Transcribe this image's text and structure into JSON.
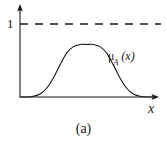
{
  "figure": {
    "caption": "(a)",
    "background_color": "#ffffff",
    "ink_color": "#1a1a1a"
  },
  "axes": {
    "y_axis_max_label": "1",
    "x_axis_label": "x",
    "origin": {
      "x": 20,
      "y": 97
    },
    "y_axis_top": {
      "x": 20,
      "y": 5
    },
    "x_axis_right": {
      "x": 158,
      "y": 97
    }
  },
  "reference_line": {
    "name": "unity-dashed-line",
    "value": 1,
    "y_pixel": 24,
    "x_start": 20,
    "x_end": 161,
    "style": "dashed",
    "dash_length": 8,
    "dash_gap": 7
  },
  "curve": {
    "label_mu": "μ",
    "label_subscript": "A",
    "label_argument": "(x)",
    "label_full": "μA (x)",
    "type": "bell",
    "peak_value": 0.72,
    "peak_pixel": {
      "x": 82,
      "y": 45
    },
    "baseline_y": 97,
    "path": "M 20 96.6 L 26 96.4 C 32 96 38 92 44 84 C 50 74 54 62 60 54 C 66 47 73 44.5 82 44.5 C 91 44.5 98 47 104 54 C 110 62 114 74 120 84 C 126 92 132 96 138 96.4 L 156 96.8"
  },
  "chart_data": {
    "type": "line",
    "title": "",
    "subtitle": "",
    "xlabel": "x",
    "ylabel": "",
    "caption": "(a)",
    "series": [
      {
        "name": "μA (x)",
        "kind": "membership-function",
        "x": [
          0.0,
          0.05,
          0.1,
          0.15,
          0.2,
          0.25,
          0.3,
          0.35,
          0.4,
          0.45,
          0.5,
          0.55,
          0.6,
          0.65,
          0.7,
          0.75,
          0.8,
          0.85,
          0.9,
          0.95,
          1.0
        ],
        "values": [
          0.0,
          0.0,
          0.01,
          0.04,
          0.12,
          0.26,
          0.44,
          0.6,
          0.69,
          0.72,
          0.72,
          0.72,
          0.69,
          0.6,
          0.44,
          0.26,
          0.12,
          0.04,
          0.01,
          0.0,
          0.0
        ]
      },
      {
        "name": "1",
        "kind": "reference-dashed",
        "x": [
          0.0,
          1.0
        ],
        "values": [
          1.0,
          1.0
        ]
      }
    ],
    "ytick_labels": [
      "1"
    ],
    "ytick_values": [
      1
    ],
    "xtick_labels": [],
    "ylim": [
      0,
      1.12
    ],
    "xlim": [
      0,
      1.02
    ],
    "grid": false,
    "legend": false,
    "annotations": [
      {
        "text": "μA (x)",
        "x": 0.66,
        "y": 0.58
      },
      {
        "text": "1",
        "x": -0.06,
        "y": 1.0
      },
      {
        "text": "x",
        "x": 0.99,
        "y": -0.08
      }
    ]
  }
}
